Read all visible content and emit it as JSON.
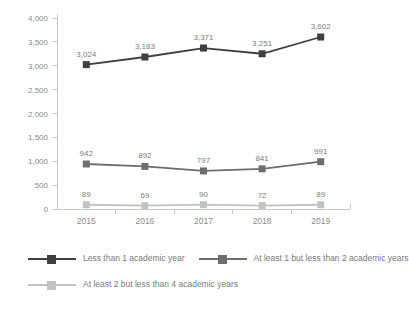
{
  "chart_data": {
    "type": "line",
    "title": "",
    "xlabel": "",
    "ylabel": "",
    "categories": [
      "2015",
      "2016",
      "2017",
      "2018",
      "2019"
    ],
    "ylim": [
      0,
      4000
    ],
    "yticks": [
      "0",
      "500",
      "1,000",
      "1,500",
      "2,000",
      "2,500",
      "3,000",
      "3,500",
      "4,000"
    ],
    "ytick_values": [
      0,
      500,
      1000,
      1500,
      2000,
      2500,
      3000,
      3500,
      4000
    ],
    "grid": false,
    "legend_position": "bottom",
    "series": [
      {
        "name": "Less than 1 academic year",
        "color": "#3f3f3f",
        "values": [
          3024,
          3183,
          3371,
          3251,
          3602
        ],
        "labels": [
          "3,024",
          "3,183",
          "3,371",
          "3,251",
          "3,602"
        ]
      },
      {
        "name": "At least 1 but less than 2 academic years",
        "color": "#6e6e6e",
        "values": [
          942,
          892,
          797,
          841,
          991
        ],
        "labels": [
          "942",
          "892",
          "797",
          "841",
          "991"
        ]
      },
      {
        "name": "At least 2 but less than 4 academic years",
        "color": "#c2c2c2",
        "values": [
          89,
          69,
          90,
          72,
          89
        ],
        "labels": [
          "89",
          "69",
          "90",
          "72",
          "89"
        ]
      }
    ]
  },
  "legend": {
    "items": [
      {
        "label": "Less than 1 academic year",
        "color": "#3f3f3f"
      },
      {
        "label": "At least 1 but less than 2 academic years",
        "color": "#6e6e6e"
      },
      {
        "label": "At least 2 but less than 4 academic years",
        "color": "#c2c2c2"
      }
    ]
  }
}
